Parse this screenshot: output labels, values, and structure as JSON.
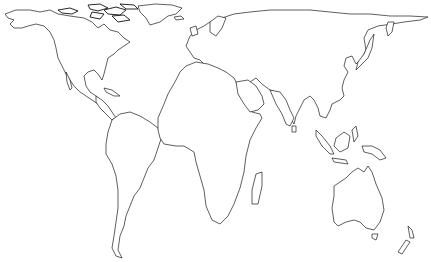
{
  "map": {
    "title": "World map outline",
    "projection": "equal-area (Gall-Peters style)",
    "background_color": "#ffffff",
    "outline_color": "#1a1a1a",
    "regions": [
      {
        "name": "North America"
      },
      {
        "name": "Greenland"
      },
      {
        "name": "Central America and Caribbean"
      },
      {
        "name": "South America"
      },
      {
        "name": "Europe"
      },
      {
        "name": "Africa"
      },
      {
        "name": "Madagascar"
      },
      {
        "name": "Asia"
      },
      {
        "name": "Arabian Peninsula"
      },
      {
        "name": "Indian Subcontinent"
      },
      {
        "name": "Japan"
      },
      {
        "name": "Southeast Asia and Indonesia"
      },
      {
        "name": "New Guinea"
      },
      {
        "name": "Australia"
      },
      {
        "name": "Tasmania"
      },
      {
        "name": "New Zealand"
      }
    ]
  }
}
